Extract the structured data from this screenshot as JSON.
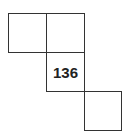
{
  "diagram": {
    "cells": [
      {
        "position": "row1-col1",
        "label": ""
      },
      {
        "position": "row1-col2",
        "label": ""
      },
      {
        "position": "row2-col2",
        "label": "136"
      },
      {
        "position": "row3-col3",
        "label": ""
      }
    ],
    "line_color": "#333333"
  }
}
